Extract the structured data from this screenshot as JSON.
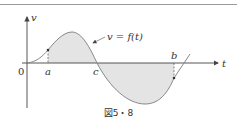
{
  "figure": {
    "caption": "図5・8",
    "axis_labels": {
      "vertical": "v",
      "horizontal": "t"
    },
    "origin_label": "0",
    "curve_label": "v = f(t)",
    "points": {
      "a": "a",
      "b": "b",
      "c": "c"
    },
    "colors": {
      "curve": "#888888",
      "shade": "#e4e4e4",
      "axis": "#444444",
      "rule": "#9a9a9a"
    }
  }
}
